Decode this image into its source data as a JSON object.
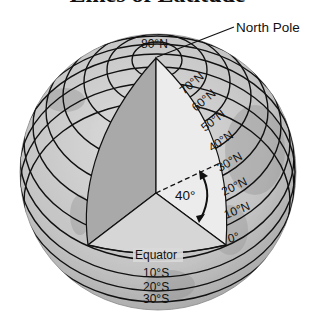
{
  "title": "Lines of Latitude",
  "callouts": {
    "north_pole": "North Pole",
    "equator": "Equator",
    "angle": "40°"
  },
  "latitude_labels": {
    "north": [
      "80°N",
      "70°N",
      "60°N",
      "50°N",
      "40°N",
      "30°N",
      "20°N",
      "10°N",
      "0°"
    ],
    "south": [
      "10°S",
      "20°S",
      "30°S"
    ]
  },
  "colors": {
    "globe_fill": "#c8c8c8",
    "left_face": "#a9a9a9",
    "right_face": "#ececec",
    "equatorial_plane": "#d6d6d6",
    "line": "#111111"
  }
}
